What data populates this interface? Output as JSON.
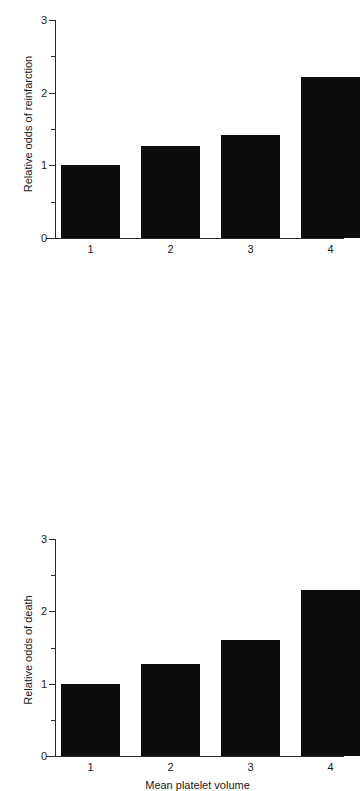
{
  "chart_data": [
    {
      "id": "reinfarction",
      "type": "bar",
      "title": "",
      "xlabel": "Mean platelet volume",
      "ylabel": "Relative odds of reinfarction",
      "categories": [
        "1",
        "2",
        "3",
        "4"
      ],
      "values": [
        1.0,
        1.27,
        1.42,
        2.22
      ],
      "ylim": [
        0,
        3
      ],
      "yticks_major": [
        "0",
        "1",
        "2",
        "3"
      ],
      "yticks_major_values": [
        0,
        1,
        2,
        3
      ],
      "yticks_minor_values": [
        0.5,
        1.5,
        2.5
      ],
      "grid": false,
      "legend": "none",
      "bar_color": "#0d0d0d",
      "axis_color": "#2b2b2b"
    },
    {
      "id": "death",
      "type": "bar",
      "title": "",
      "xlabel": "Mean platelet volume",
      "ylabel": "Relative odds of death",
      "categories": [
        "1",
        "2",
        "3",
        "4"
      ],
      "values": [
        1.0,
        1.27,
        1.6,
        2.3
      ],
      "ylim": [
        0,
        3
      ],
      "yticks_major": [
        "0",
        "1",
        "2",
        "3"
      ],
      "yticks_major_values": [
        0,
        1,
        2,
        3
      ],
      "yticks_minor_values": [
        0.5,
        1.5,
        2.5
      ],
      "grid": false,
      "legend": "none",
      "bar_color": "#0d0d0d",
      "axis_color": "#2b2b2b"
    }
  ],
  "charts": {
    "top": {
      "ylabel": "Relative odds of reinfarction",
      "xlabel": "Mean platelet volume",
      "yticks": [
        "3",
        "2",
        "1",
        "0"
      ],
      "xticks": [
        "1",
        "2",
        "3",
        "4"
      ]
    },
    "bottom": {
      "ylabel": "Relative odds of death",
      "xlabel": "Mean platelet volume",
      "yticks": [
        "3",
        "2",
        "1",
        "0"
      ],
      "xticks": [
        "1",
        "2",
        "3",
        "4"
      ]
    }
  }
}
